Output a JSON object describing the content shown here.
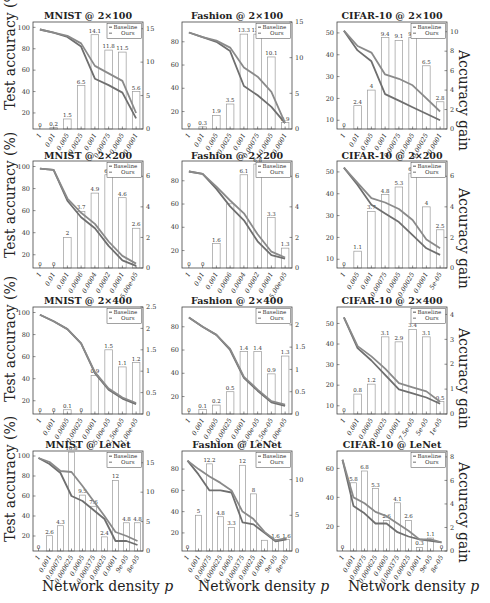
{
  "figure": {
    "y_label_left": "Test accuracy (%)",
    "y_label_right": "Accuracy gain",
    "x_label": "Network density",
    "x_label_var": "p",
    "legend": [
      "Baseline",
      "Ours"
    ],
    "colors": {
      "baseline": "#6f6f6f",
      "ours": "#8a8a8a",
      "bar_edge": "#9a9a9a",
      "axis": "#444444"
    }
  },
  "chart_data": [
    {
      "type": "bar+line",
      "title": "MNIST @ 2×100",
      "categories": [
        "1",
        "0.01",
        "0.005",
        "0.0025",
        "0.001",
        "0.00075",
        "0.0005",
        "0.0001"
      ],
      "ylim": [
        5,
        105
      ],
      "yticks": [
        20,
        40,
        60,
        80,
        100
      ],
      "y2lim": [
        0,
        16
      ],
      "y2ticks": [
        0,
        5,
        10,
        15
      ],
      "series": [
        {
          "name": "Baseline",
          "values": [
            98,
            95,
            91,
            82,
            52,
            46,
            39,
            15
          ]
        },
        {
          "name": "Ours",
          "values": [
            98,
            95,
            92,
            85,
            64,
            57,
            50,
            20
          ]
        }
      ],
      "gain": [
        0,
        0.2,
        1.5,
        6.5,
        14.1,
        11.8,
        11.5,
        5.6
      ],
      "gain_labels": [
        "0",
        "0.2",
        "1.5",
        "6.5",
        "14.1",
        "11.8",
        "11.5",
        "5.6"
      ],
      "legend_position": "upper right"
    },
    {
      "type": "bar+line",
      "title": "Fashion @ 2×100",
      "categories": [
        "1",
        "0.01",
        "0.005",
        "0.0025",
        "0.001",
        "0.00075",
        "0.0005",
        "0.0001"
      ],
      "ylim": [
        5,
        97
      ],
      "yticks": [
        20,
        40,
        60,
        80
      ],
      "y2lim": [
        0,
        15
      ],
      "y2ticks": [
        0,
        5,
        10,
        15
      ],
      "series": [
        {
          "name": "Baseline",
          "values": [
            88,
            84,
            80,
            72,
            42,
            34,
            24,
            10
          ]
        },
        {
          "name": "Ours",
          "values": [
            88,
            84,
            81,
            75,
            58,
            50,
            37,
            10
          ]
        }
      ],
      "gain": [
        0,
        0.3,
        1.9,
        3.5,
        13.3,
        13.3,
        10.1,
        0.9
      ],
      "gain_labels": [
        "0",
        "0.3",
        "1.9",
        "3.5",
        "13.3",
        "13.3",
        "10.1",
        "0.9"
      ],
      "legend_position": "upper right"
    },
    {
      "type": "bar+line",
      "title": "CIFAR-10 @ 2×100",
      "categories": [
        "1",
        "0.01",
        "0.005",
        "0.001",
        "0.00075",
        "0.0005",
        "0.00025",
        "0.0001"
      ],
      "ylim": [
        6,
        55
      ],
      "yticks": [
        10,
        20,
        30,
        40,
        50
      ],
      "y2lim": [
        0,
        11
      ],
      "y2ticks": [
        0,
        2,
        4,
        6,
        8,
        10
      ],
      "series": [
        {
          "name": "Baseline",
          "values": [
            51,
            42,
            37,
            22,
            19,
            16,
            13,
            10
          ]
        },
        {
          "name": "Ours",
          "values": [
            51,
            44,
            41,
            31,
            29,
            26,
            20,
            14
          ]
        }
      ],
      "gain": [
        0,
        2.4,
        4,
        9.4,
        9.1,
        9.4,
        6.5,
        2.8
      ],
      "gain_labels": [
        "0",
        "2.4",
        "4",
        "9.4",
        "9.1",
        "9.4",
        "6.5",
        "2.8"
      ],
      "legend_position": "upper right"
    },
    {
      "type": "bar+line",
      "title": "MNIST @ 2×200",
      "categories": [
        "1",
        "0.01",
        "0.001",
        "0.0006",
        "0.0004",
        "0.0002",
        "0.0001",
        "5.00e-05"
      ],
      "ylim": [
        8,
        105
      ],
      "yticks": [
        20,
        40,
        60,
        80,
        100
      ],
      "y2lim": [
        0,
        7
      ],
      "y2ticks": [
        0,
        2,
        4,
        6
      ],
      "series": [
        {
          "name": "Baseline",
          "values": [
            98,
            97,
            69,
            54,
            44,
            28,
            15,
            10
          ]
        },
        {
          "name": "Ours",
          "values": [
            98,
            97,
            71,
            58,
            48,
            32,
            19,
            12
          ]
        }
      ],
      "gain": [
        0,
        0,
        2,
        3.7,
        4.9,
        6.1,
        4.6,
        2.6
      ],
      "gain_labels": [
        "0",
        "0",
        "2",
        "3.7",
        "4.9",
        "6.1",
        "4.6",
        "2.6"
      ],
      "legend_position": "upper right"
    },
    {
      "type": "bar+line",
      "title": "Fashion @ 2×200",
      "categories": [
        "1",
        "0.01",
        "0.001",
        "0.0006",
        "0.0004",
        "0.0002",
        "0.0001",
        "5.00e-05"
      ],
      "ylim": [
        5,
        97
      ],
      "yticks": [
        20,
        40,
        60,
        80
      ],
      "y2lim": [
        0,
        7
      ],
      "y2ticks": [
        0,
        2,
        4,
        6
      ],
      "series": [
        {
          "name": "Baseline",
          "values": [
            88,
            86,
            73,
            58,
            46,
            28,
            16,
            13
          ]
        },
        {
          "name": "Ours",
          "values": [
            88,
            86,
            75,
            63,
            52,
            34,
            19,
            14
          ]
        }
      ],
      "gain": [
        0,
        0,
        1.6,
        4.2,
        6.1,
        6.8,
        3.3,
        1.3
      ],
      "gain_labels": [
        "0",
        "0",
        "1.6",
        "",
        "6.1",
        "6.8",
        "3.3",
        "1.3"
      ],
      "legend_position": "upper right"
    },
    {
      "type": "bar+line",
      "title": "CIFAR-10 @ 2×200",
      "categories": [
        "1",
        "0.005",
        "0.001",
        "0.00075",
        "0.0005",
        "0.00025",
        "0.0001",
        "5e-05"
      ],
      "ylim": [
        6,
        55
      ],
      "yticks": [
        10,
        20,
        30,
        40,
        50
      ],
      "y2lim": [
        0,
        7
      ],
      "y2ticks": [
        0,
        2,
        4,
        6
      ],
      "series": [
        {
          "name": "Baseline",
          "values": [
            52,
            44,
            35,
            31,
            27,
            21,
            15,
            12
          ]
        },
        {
          "name": "Ours",
          "values": [
            52,
            45,
            38,
            36,
            33,
            28,
            19,
            15
          ]
        }
      ],
      "gain": [
        0,
        1.1,
        3.7,
        4.8,
        5.3,
        6.2,
        4,
        2.5
      ],
      "gain_labels": [
        "0",
        "1.1",
        "3.7",
        "4.8",
        "5.3",
        "6.2",
        "4",
        "2.5"
      ],
      "legend_position": "upper right"
    },
    {
      "type": "bar+line",
      "title": "MNIST @ 2×400",
      "categories": [
        "1",
        "0.001",
        "0.0005",
        "0.00025",
        "0.0001",
        "5.00e-05",
        "2.50e-05",
        "1.00e-05"
      ],
      "ylim": [
        8,
        105
      ],
      "yticks": [
        20,
        40,
        60,
        80,
        100
      ],
      "y2lim": [
        0,
        2.5
      ],
      "y2ticks": [
        0,
        0.5,
        1,
        1.5,
        2,
        2.5
      ],
      "series": [
        {
          "name": "Baseline",
          "values": [
            98,
            92,
            85,
            72,
            45,
            30,
            22,
            17
          ]
        },
        {
          "name": "Ours",
          "values": [
            98,
            92,
            85,
            72,
            46,
            31,
            23,
            18
          ]
        }
      ],
      "gain": [
        0,
        0,
        0.1,
        0,
        0.9,
        1.5,
        1.1,
        1.2
      ],
      "gain_labels": [
        "0",
        "0",
        "0.1",
        "0",
        "0.9",
        "1.5",
        "1.1",
        "1.2"
      ],
      "legend_position": "upper right"
    },
    {
      "type": "bar+line",
      "title": "Fashion @ 2×400",
      "categories": [
        "1",
        "0.001",
        "0.0005",
        "0.00025",
        "0.0001",
        "5.00e-05",
        "2.50e-05",
        "1.00e-05"
      ],
      "ylim": [
        5,
        97
      ],
      "yticks": [
        20,
        40,
        60,
        80
      ],
      "y2lim": [
        0,
        2.4
      ],
      "y2ticks": [
        0,
        0.5,
        1,
        1.5,
        2
      ],
      "series": [
        {
          "name": "Baseline",
          "values": [
            88,
            80,
            73,
            60,
            36,
            25,
            15,
            12
          ]
        },
        {
          "name": "Ours",
          "values": [
            88,
            80,
            73,
            61,
            37,
            26,
            16,
            13
          ]
        }
      ],
      "gain": [
        0,
        0.1,
        0.2,
        0.5,
        1.4,
        1.4,
        0.9,
        1.3
      ],
      "gain_labels": [
        "0",
        "0.1",
        "0.2",
        "0.5",
        "1.4",
        "1.4",
        "0.9",
        "1.3"
      ],
      "legend_position": "upper right"
    },
    {
      "type": "bar+line",
      "title": "CIFAR-10 @ 2×400",
      "categories": [
        "1",
        "0.001",
        "0.0005",
        "0.00025",
        "0.0001",
        "7.5e-05",
        "5e-05",
        "1e-05"
      ],
      "ylim": [
        6,
        58
      ],
      "yticks": [
        10,
        20,
        30,
        40,
        50
      ],
      "y2lim": [
        0,
        4.3
      ],
      "y2ticks": [
        0,
        1,
        2,
        3,
        4
      ],
      "series": [
        {
          "name": "Baseline",
          "values": [
            53,
            38,
            32,
            25,
            18,
            16,
            14,
            11
          ]
        },
        {
          "name": "Ours",
          "values": [
            53,
            39,
            34,
            28,
            21,
            19,
            17,
            12
          ]
        }
      ],
      "gain": [
        0,
        0.8,
        1.2,
        3.1,
        2.9,
        3.4,
        3.1,
        0.5
      ],
      "gain_labels": [
        "0",
        "0.8",
        "1.2",
        "3.1",
        "2.9",
        "3.4",
        "3.1",
        "0.5"
      ],
      "legend_position": "upper right"
    },
    {
      "type": "bar+line",
      "title": "MNIST @ LeNet",
      "categories": [
        "1",
        "0.001",
        "0.00075",
        "0.000625",
        "0.0005",
        "0.000375",
        "0.00025",
        "0.0001",
        "9e-05",
        "8e-05"
      ],
      "ylim": [
        5,
        105
      ],
      "yticks": [
        20,
        40,
        60,
        80,
        100
      ],
      "y2lim": [
        0,
        17
      ],
      "y2ticks": [
        0,
        5,
        10,
        15
      ],
      "series": [
        {
          "name": "Baseline",
          "values": [
            98,
            92,
            83,
            60,
            55,
            46,
            37,
            15,
            15,
            11
          ]
        },
        {
          "name": "Ours",
          "values": [
            98,
            94,
            85,
            84,
            70,
            55,
            40,
            24,
            20,
            15
          ]
        }
      ],
      "gain": [
        0,
        2.6,
        4.3,
        16.8,
        9.5,
        7.6,
        2.4,
        12,
        4.8,
        4.8
      ],
      "gain_labels": [
        "0",
        "2.6",
        "4.3",
        "16.8",
        "9.5",
        "7.6",
        "2.4",
        "12",
        "4.8",
        "4.8"
      ],
      "legend_position": "upper right"
    },
    {
      "type": "bar+line",
      "title": "Fashion @ LeNet",
      "categories": [
        "1",
        "0.001",
        "0.00075",
        "0.000625",
        "0.0005",
        "0.000375",
        "0.00025",
        "0.0001",
        "9e-05",
        "8e-05"
      ],
      "ylim": [
        3,
        97
      ],
      "yticks": [
        20,
        40,
        60,
        80
      ],
      "y2lim": [
        0,
        14
      ],
      "y2ticks": [
        0,
        5,
        10
      ],
      "series": [
        {
          "name": "Baseline",
          "values": [
            88,
            75,
            60,
            60,
            58,
            30,
            28,
            20,
            12,
            14
          ]
        },
        {
          "name": "Ours",
          "values": [
            88,
            80,
            73,
            67,
            60,
            40,
            33,
            21,
            13,
            15
          ]
        }
      ],
      "gain": [
        0,
        5,
        12.2,
        4.8,
        3.3,
        12,
        8,
        1.5,
        1.6,
        1.6
      ],
      "gain_labels": [
        "0",
        "5",
        "12.2",
        "4.8",
        "3.3",
        "12",
        "8",
        "",
        "1.6",
        "1.6"
      ],
      "legend_position": "upper right"
    },
    {
      "type": "bar+line",
      "title": "CIFAR-10 @ LeNet",
      "categories": [
        "1",
        "0.001",
        "0.00075",
        "0.000625",
        "0.0005",
        "0.000375",
        "0.00025",
        "0.0001",
        "9e-05",
        "8e-05"
      ],
      "ylim": [
        3,
        72
      ],
      "yticks": [
        20,
        40,
        60
      ],
      "y2lim": [
        0,
        8.5
      ],
      "y2ticks": [
        0,
        2,
        4,
        6,
        8
      ],
      "series": [
        {
          "name": "Baseline",
          "values": [
            66,
            34,
            29,
            22,
            22,
            16,
            13,
            11,
            10,
            9
          ]
        },
        {
          "name": "Ours",
          "values": [
            66,
            40,
            36,
            30,
            27,
            22,
            17,
            11,
            11,
            9
          ]
        }
      ],
      "gain": [
        0,
        5.8,
        6.8,
        5.3,
        2.6,
        4.1,
        2.6,
        0.3,
        1.1,
        0
      ],
      "gain_labels": [
        "0",
        "5.8",
        "6.8",
        "5.3",
        "2.6",
        "4.1",
        "2.6",
        "0.3",
        "1.1",
        "0"
      ],
      "legend_position": "upper right"
    }
  ]
}
